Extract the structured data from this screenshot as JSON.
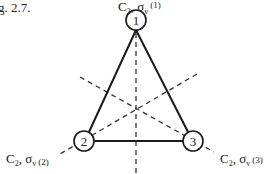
{
  "caption": "g. 2.7.",
  "nodes": [
    {
      "id": "1",
      "label": "1",
      "cx": 136,
      "cy": 20
    },
    {
      "id": "2",
      "label": "2",
      "cx": 84,
      "cy": 141
    },
    {
      "id": "3",
      "label": "3",
      "cx": 193,
      "cy": 141
    }
  ],
  "axes": [
    {
      "main": "C",
      "sub": "2",
      "sep": ", σ",
      "sub2": "v",
      "paren": "(1)"
    },
    {
      "main": "C",
      "sub": "2",
      "sep": ", σ",
      "sub2": "v",
      "paren": "(2)"
    },
    {
      "main": "C",
      "sub": "2",
      "sep": ", σ",
      "sub2": "v",
      "paren": "(3)"
    }
  ],
  "colors": {
    "line": "#1a1a1a",
    "text": "#222222"
  }
}
